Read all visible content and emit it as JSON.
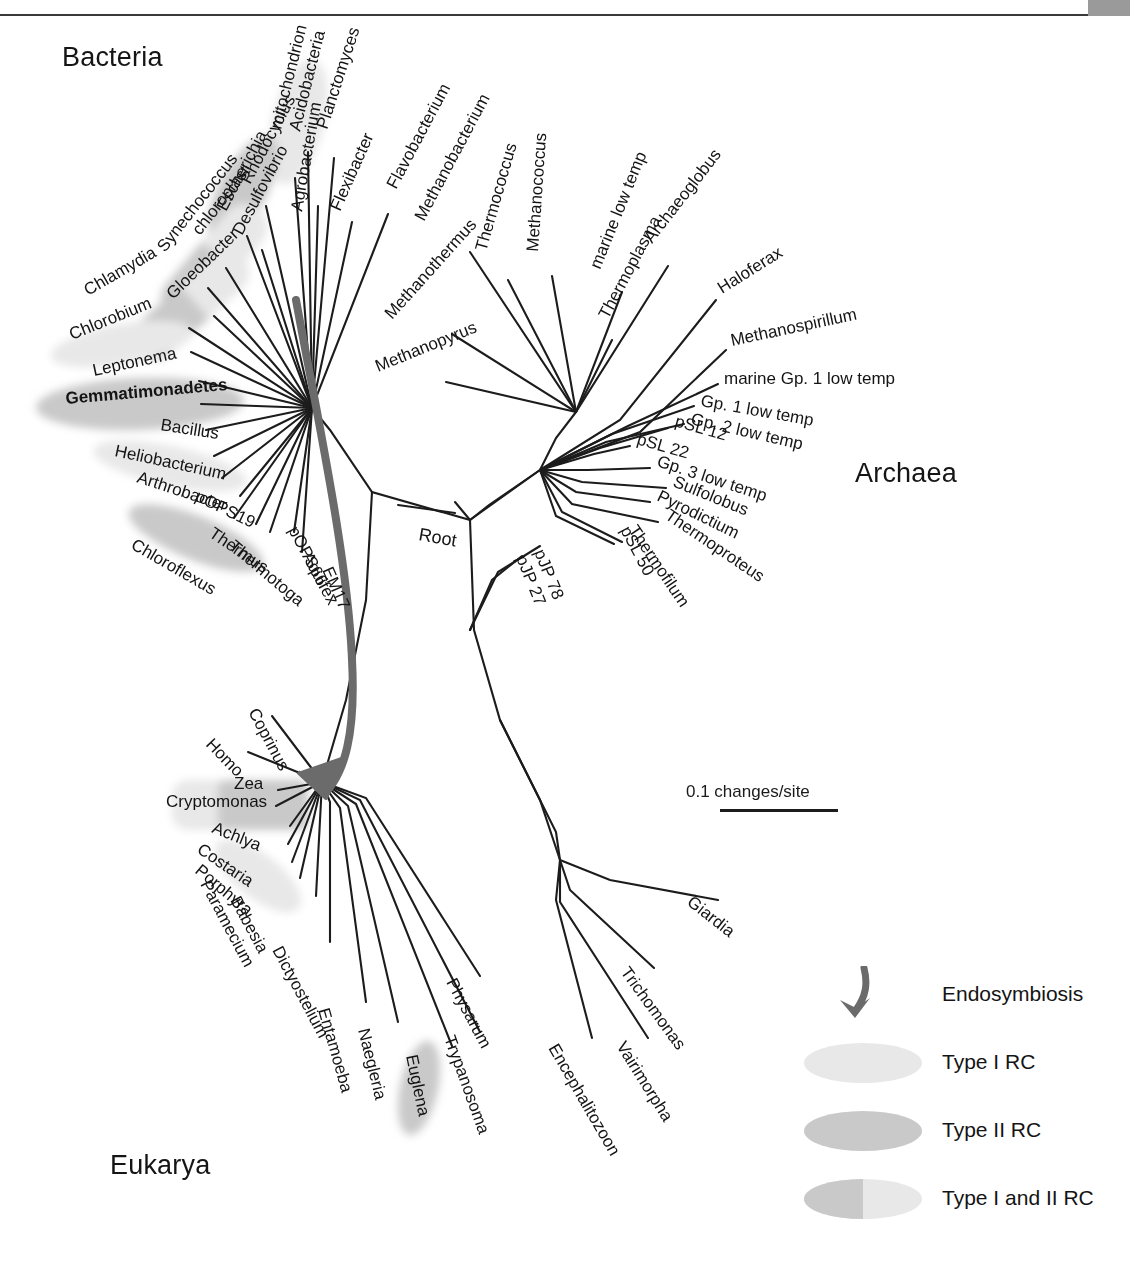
{
  "figure": {
    "type": "unrooted-phylogenetic-tree",
    "header_strip_text": "",
    "domains": [
      {
        "name": "Bacteria",
        "x": 62,
        "y": 42
      },
      {
        "name": "Archaea",
        "x": 855,
        "y": 458
      },
      {
        "name": "Eukarya",
        "x": 110,
        "y": 1150
      }
    ],
    "root_label": "Root",
    "scale": {
      "label": "0.1 changes/site",
      "x": 686,
      "y": 782,
      "bar_length_px": 118
    }
  },
  "legend": {
    "items": [
      {
        "key": "endosymbiosis-arrow",
        "label": "Endosymbiosis",
        "swatch": "arrow"
      },
      {
        "key": "type-1-rc",
        "label": "Type I RC",
        "swatch": "ellipse-light"
      },
      {
        "key": "type-2-rc",
        "label": "Type II RC",
        "swatch": "ellipse-medium"
      },
      {
        "key": "type-1-and-2-rc",
        "label": "Type I and II RC",
        "swatch": "ellipse-split"
      }
    ]
  },
  "colors": {
    "line": "#1c1c1c",
    "endosymbiosis_arrow": "#6b6b6b",
    "type1": "#e8e8e8",
    "type2": "#c9c9c9",
    "text": "#141414",
    "header_box": "#9a9a9a"
  },
  "tree": {
    "center_bacteria": {
      "x": 312,
      "y": 408
    },
    "center_archaea": {
      "x": 540,
      "y": 470
    },
    "center_eukarya": {
      "x": 312,
      "y": 820
    },
    "root_node": {
      "x": 470,
      "y": 520
    },
    "taxa": {
      "bacteria": [
        {
          "label": "Acidobacteria",
          "tipx": 305,
          "tipy": 142,
          "lx": 300,
          "ly": 132,
          "rot": -76,
          "hl": "type1",
          "anchor": "start"
        },
        {
          "label": "mitochondrion",
          "tipx": 290,
          "tipy": 170,
          "lx": 281,
          "ly": 130,
          "rot": -76,
          "hl": "none",
          "anchor": "start"
        },
        {
          "label": "Rhodocyclus",
          "tipx": 263,
          "tipy": 200,
          "lx": 250,
          "ly": 185,
          "rot": -62,
          "hl": "type2",
          "anchor": "start"
        },
        {
          "label": "Escherichia",
          "tipx": 243,
          "tipy": 230,
          "lx": 226,
          "ly": 212,
          "rot": -62,
          "hl": "none",
          "anchor": "start"
        },
        {
          "label": "Desulfovibrio",
          "tipx": 258,
          "tipy": 246,
          "lx": 242,
          "ly": 236,
          "rot": -62,
          "hl": "none",
          "anchor": "start"
        },
        {
          "label": "chloroplast",
          "tipx": 222,
          "tipy": 262,
          "lx": 200,
          "ly": 236,
          "rot": -52,
          "hl": "type1",
          "anchor": "start"
        },
        {
          "label": "Synechococcus",
          "tipx": 204,
          "tipy": 282,
          "lx": 165,
          "ly": 253,
          "rot": -52,
          "hl": "type12",
          "anchor": "start"
        },
        {
          "label": "Gloeobacter",
          "tipx": 210,
          "tipy": 310,
          "lx": 173,
          "ly": 300,
          "rot": -44,
          "hl": "type12",
          "anchor": "start"
        },
        {
          "label": "Chlamydia",
          "tipx": 186,
          "tipy": 322,
          "lx": 88,
          "ly": 296,
          "rot": -30,
          "hl": "none",
          "anchor": "start"
        },
        {
          "label": "Chlorobium",
          "tipx": 188,
          "tipy": 346,
          "lx": 72,
          "ly": 340,
          "rot": -22,
          "hl": "type1",
          "anchor": "start"
        },
        {
          "label": "Leptonema",
          "tipx": 196,
          "tipy": 376,
          "lx": 94,
          "ly": 376,
          "rot": -12,
          "hl": "none",
          "anchor": "start"
        },
        {
          "label": "Gemmatimonadetes",
          "tipx": 198,
          "tipy": 400,
          "lx": 66,
          "ly": 404,
          "rot": -5,
          "hl": "type2",
          "anchor": "start",
          "bold": true
        },
        {
          "label": "Bacillus",
          "tipx": 204,
          "tipy": 426,
          "lx": 160,
          "ly": 430,
          "rot": 9,
          "hl": "none",
          "anchor": "start"
        },
        {
          "label": "Heliobacterium",
          "tipx": 212,
          "tipy": 452,
          "lx": 114,
          "ly": 456,
          "rot": 12,
          "hl": "type1",
          "anchor": "start"
        },
        {
          "label": "Arthrobacter",
          "tipx": 220,
          "tipy": 474,
          "lx": 136,
          "ly": 482,
          "rot": 18,
          "hl": "none",
          "anchor": "start"
        },
        {
          "label": "pOPS19",
          "tipx": 238,
          "tipy": 492,
          "lx": 194,
          "ly": 500,
          "rot": 26,
          "hl": "none",
          "anchor": "start"
        },
        {
          "label": "Chloroflexus",
          "tipx": 232,
          "tipy": 514,
          "lx": 130,
          "ly": 548,
          "rot": 30,
          "hl": "type2",
          "anchor": "start"
        },
        {
          "label": "Thermus",
          "tipx": 254,
          "tipy": 520,
          "lx": 208,
          "ly": 536,
          "rot": 34,
          "hl": "none",
          "anchor": "start"
        },
        {
          "label": "Thermotoga",
          "tipx": 268,
          "tipy": 528,
          "lx": 228,
          "ly": 548,
          "rot": 40,
          "hl": "none",
          "anchor": "start"
        },
        {
          "label": "pOPS66",
          "tipx": 292,
          "tipy": 528,
          "lx": 288,
          "ly": 530,
          "rot": 62,
          "hl": "none",
          "anchor": "start"
        },
        {
          "label": "Aquifex",
          "tipx": 300,
          "tipy": 548,
          "lx": 302,
          "ly": 556,
          "rot": 62,
          "hl": "none",
          "anchor": "start"
        },
        {
          "label": "EM17",
          "tipx": 312,
          "tipy": 566,
          "lx": 322,
          "ly": 570,
          "rot": 66,
          "hl": "none",
          "anchor": "start"
        },
        {
          "label": "Agrobacterium",
          "tipx": 316,
          "tipy": 200,
          "lx": 302,
          "ly": 212,
          "rot": -80,
          "hl": "none",
          "anchor": "start"
        },
        {
          "label": "Flexibacter",
          "tipx": 348,
          "tipy": 216,
          "lx": 340,
          "ly": 212,
          "rot": -66,
          "hl": "none",
          "anchor": "start"
        },
        {
          "label": "Planctomyces",
          "tipx": 330,
          "tipy": 152,
          "lx": 327,
          "ly": 130,
          "rot": -72,
          "hl": "none",
          "anchor": "start"
        },
        {
          "label": "Flavobacterium",
          "tipx": 384,
          "tipy": 208,
          "lx": 396,
          "ly": 190,
          "rot": -62,
          "hl": "none",
          "anchor": "start"
        }
      ],
      "archaea": [
        {
          "label": "Methanopyrus",
          "lx": 378,
          "ly": 372,
          "rot": -22
        },
        {
          "label": "Methanothermus",
          "lx": 392,
          "ly": 320,
          "rot": -48
        },
        {
          "label": "Methanobacterium",
          "lx": 424,
          "ly": 222,
          "rot": -62
        },
        {
          "label": "Thermococcus",
          "lx": 486,
          "ly": 252,
          "rot": -74
        },
        {
          "label": "Methanococcus",
          "lx": 538,
          "ly": 252,
          "rot": -86
        },
        {
          "label": "marine low temp",
          "lx": 600,
          "ly": 270,
          "rot": -68
        },
        {
          "label": "Thermoplasma",
          "lx": 608,
          "ly": 320,
          "rot": -62
        },
        {
          "label": "Archaeoglobus",
          "lx": 652,
          "ly": 244,
          "rot": -52
        },
        {
          "label": "Haloferax",
          "lx": 722,
          "ly": 294,
          "rot": -32
        },
        {
          "label": "Methanospirillum",
          "lx": 732,
          "ly": 346,
          "rot": -12
        },
        {
          "label": "marine Gp. 1 low temp",
          "lx": 724,
          "ly": 384,
          "rot": 0
        },
        {
          "label": "Gp. 1 low temp",
          "lx": 700,
          "ly": 406,
          "rot": 10
        },
        {
          "label": "Gp. 2 low temp",
          "lx": 690,
          "ly": 424,
          "rot": 13
        },
        {
          "label": "pSL 12",
          "lx": 674,
          "ly": 426,
          "rot": 16
        },
        {
          "label": "pSL 22",
          "lx": 636,
          "ly": 444,
          "rot": 16
        },
        {
          "label": "Gp. 3 low temp",
          "lx": 656,
          "ly": 466,
          "rot": 18
        },
        {
          "label": "Sulfolobus",
          "lx": 672,
          "ly": 486,
          "rot": 22
        },
        {
          "label": "Pyrodictium",
          "lx": 656,
          "ly": 500,
          "rot": 26
        },
        {
          "label": "Thermoproteus",
          "lx": 664,
          "ly": 518,
          "rot": 34
        },
        {
          "label": "Thermofilum",
          "lx": 628,
          "ly": 530,
          "rot": 56
        },
        {
          "label": "pSL 50",
          "lx": 620,
          "ly": 530,
          "rot": 62
        },
        {
          "label": "pJP 78",
          "lx": 534,
          "ly": 552,
          "rot": 68
        },
        {
          "label": "pJP 27",
          "lx": 516,
          "ly": 558,
          "rot": 68
        }
      ],
      "eukarya": [
        {
          "label": "Coprinus",
          "lx": 248,
          "ly": 712,
          "rot": 62,
          "hl": "none"
        },
        {
          "label": "Homo",
          "lx": 205,
          "ly": 745,
          "rot": 46,
          "hl": "none"
        },
        {
          "label": "Zea",
          "lx": 234,
          "ly": 789,
          "rot": 0,
          "hl": "type2"
        },
        {
          "label": "Cryptomonas",
          "lx": 166,
          "ly": 807,
          "rot": 0,
          "hl": "type12"
        },
        {
          "label": "Achlya",
          "lx": 211,
          "ly": 832,
          "rot": 22,
          "hl": "none"
        },
        {
          "label": "Costaria",
          "lx": 196,
          "ly": 852,
          "rot": 34,
          "hl": "type1"
        },
        {
          "label": "Porphyra",
          "lx": 194,
          "ly": 872,
          "rot": 40,
          "hl": "type1"
        },
        {
          "label": "Paramecium",
          "lx": 200,
          "ly": 884,
          "rot": 62,
          "hl": "none"
        },
        {
          "label": "Babesia",
          "lx": 230,
          "ly": 900,
          "rot": 62,
          "hl": "none"
        },
        {
          "label": "Dictyostelium",
          "lx": 272,
          "ly": 950,
          "rot": 62,
          "hl": "none"
        },
        {
          "label": "Entamoeba",
          "lx": 318,
          "ly": 1010,
          "rot": 74,
          "hl": "none"
        },
        {
          "label": "Naegleria",
          "lx": 358,
          "ly": 1030,
          "rot": 76,
          "hl": "none"
        },
        {
          "label": "Euglena",
          "lx": 406,
          "ly": 1056,
          "rot": 78,
          "hl": "type1"
        },
        {
          "label": "Trypanosoma",
          "lx": 444,
          "ly": 1038,
          "rot": 70,
          "hl": "none"
        },
        {
          "label": "Physarum",
          "lx": 446,
          "ly": 982,
          "rot": 62,
          "hl": "none"
        },
        {
          "label": "Encephalitozoon",
          "lx": 548,
          "ly": 1048,
          "rot": 60,
          "hl": "none"
        },
        {
          "label": "Vairimorpha",
          "lx": 616,
          "ly": 1046,
          "rot": 58,
          "hl": "none"
        },
        {
          "label": "Trichomonas",
          "lx": 620,
          "ly": 972,
          "rot": 54,
          "hl": "none"
        },
        {
          "label": "Giardia",
          "lx": 686,
          "ly": 904,
          "rot": 38,
          "hl": "none"
        }
      ]
    }
  }
}
